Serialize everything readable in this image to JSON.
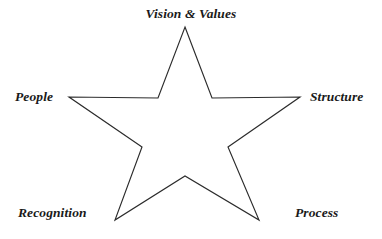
{
  "diagram": {
    "type": "five-pointed-star",
    "title": "",
    "background_color": "#ffffff",
    "stroke_color": "#2b2b2b",
    "text_color": "#1a1a1a",
    "nodes": [
      {
        "id": "vision",
        "label": "Vision & Values",
        "position": "top"
      },
      {
        "id": "structure",
        "label": "Structure",
        "position": "right"
      },
      {
        "id": "process",
        "label": "Process",
        "position": "bottom-right"
      },
      {
        "id": "recognition",
        "label": "Recognition",
        "position": "bottom-left"
      },
      {
        "id": "people",
        "label": "People",
        "position": "left"
      }
    ],
    "shape": {
      "outer_points": [
        {
          "x": 185,
          "y": 27
        },
        {
          "x": 300,
          "y": 97
        },
        {
          "x": 259,
          "y": 220
        },
        {
          "x": 115,
          "y": 220
        },
        {
          "x": 69,
          "y": 97
        }
      ],
      "inner_points": [
        {
          "x": 212,
          "y": 98
        },
        {
          "x": 228,
          "y": 147
        },
        {
          "x": 185,
          "y": 176
        },
        {
          "x": 142,
          "y": 147
        },
        {
          "x": 158,
          "y": 98
        }
      ],
      "path": "M185,27 L212,98 L300,97 L228,147 L259,220 L185,176 L115,220 L142,147 L69,97 L158,98 Z"
    }
  }
}
